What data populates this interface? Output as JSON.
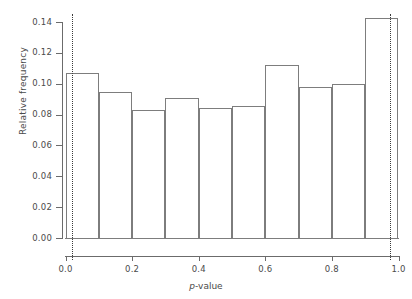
{
  "chart_data": {
    "type": "bar",
    "title": "",
    "subtitle": "",
    "xlabel": "p-value",
    "xlabel_italic_prefix": "p",
    "xlabel_rest": "-value",
    "ylabel": "Relative frequency",
    "xlim": [
      0.0,
      1.0
    ],
    "ylim": [
      0.0,
      0.145
    ],
    "grid": false,
    "legend": null,
    "bin_width": 0.1,
    "bin_edges": [
      0.0,
      0.1,
      0.2,
      0.3,
      0.4,
      0.5,
      0.6,
      0.7,
      0.8,
      0.9,
      1.0
    ],
    "categories": [
      "0.0-0.1",
      "0.1-0.2",
      "0.2-0.3",
      "0.3-0.4",
      "0.4-0.5",
      "0.5-0.6",
      "0.6-0.7",
      "0.7-0.8",
      "0.8-0.9",
      "0.9-1.0"
    ],
    "values": [
      0.107,
      0.0945,
      0.083,
      0.091,
      0.0842,
      0.0855,
      0.112,
      0.098,
      0.0995,
      0.1425
    ],
    "xticks": [
      0.0,
      0.2,
      0.4,
      0.6,
      0.8,
      1.0
    ],
    "xtick_labels": [
      "0.0",
      "0.2",
      "0.4",
      "0.6",
      "0.8",
      "1.0"
    ],
    "yticks": [
      0.0,
      0.02,
      0.04,
      0.06,
      0.08,
      0.1,
      0.12,
      0.14
    ],
    "ytick_labels": [
      "0.00",
      "0.02",
      "0.04",
      "0.06",
      "0.08",
      "0.10",
      "0.12",
      "0.14"
    ],
    "reference_lines": [
      {
        "name": "lower-reference-line",
        "x": 0.02,
        "style": "dotted"
      },
      {
        "name": "upper-reference-line",
        "x": 0.975,
        "style": "dotted"
      }
    ],
    "colors": {
      "bar_outline": "#7d7d7d",
      "axis": "#6b6b6b",
      "text": "#4a4a4a",
      "reference_line": "#3a3a3a",
      "background": "#ffffff"
    }
  },
  "top_clip": {
    "left_text": "",
    "right_text": ""
  }
}
